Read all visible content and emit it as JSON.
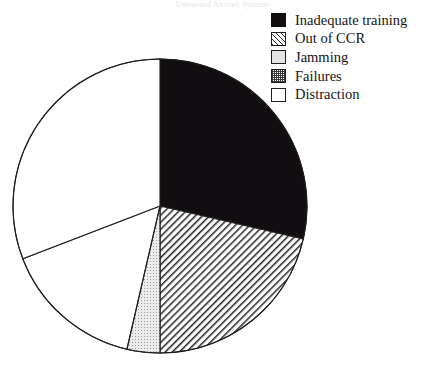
{
  "page": {
    "header_text": "Unmanned Aircraft Systems",
    "folio": ""
  },
  "chart_data": {
    "type": "pie",
    "title": "",
    "subtitle": "",
    "xlabel": "",
    "ylabel": "",
    "legend_position": "top-right",
    "grid": false,
    "total_degrees": 360,
    "categories": [
      "Inadequate training",
      "Out of CCR",
      "Jamming",
      "Failures",
      "Distraction"
    ],
    "values": [
      28.6,
      21.4,
      3.6,
      15.6,
      30.8
    ],
    "slices": [
      {
        "label": "Inadequate training",
        "percent": 28.6,
        "start_angle": 0,
        "end_angle": 103,
        "pattern": "solid-black",
        "color": "#120d10",
        "swatch_class": "fill-solid-black"
      },
      {
        "label": "Out of CCR",
        "percent": 21.4,
        "start_angle": 103,
        "end_angle": 180,
        "pattern": "diagonal-hatch",
        "color": "#ffffff",
        "swatch_class": "fill-diagonal-hatch"
      },
      {
        "label": "Jamming",
        "percent": 3.6,
        "start_angle": 180,
        "end_angle": 193,
        "pattern": "light-gray",
        "color": "#e4e4e4",
        "swatch_class": "fill-light-gray"
      },
      {
        "label": "Failures",
        "percent": 15.6,
        "start_angle": 193,
        "end_angle": 249,
        "pattern": "checkered",
        "color": "#8a8a8a",
        "swatch_class": "fill-checker"
      },
      {
        "label": "Distraction",
        "percent": 30.8,
        "start_angle": 249,
        "end_angle": 360,
        "pattern": "white",
        "color": "#ffffff",
        "swatch_class": "fill-white"
      }
    ],
    "geometry": {
      "center_x": 160,
      "center_y": 206,
      "radius": 147,
      "outline_color": "#1d1d1d"
    }
  }
}
